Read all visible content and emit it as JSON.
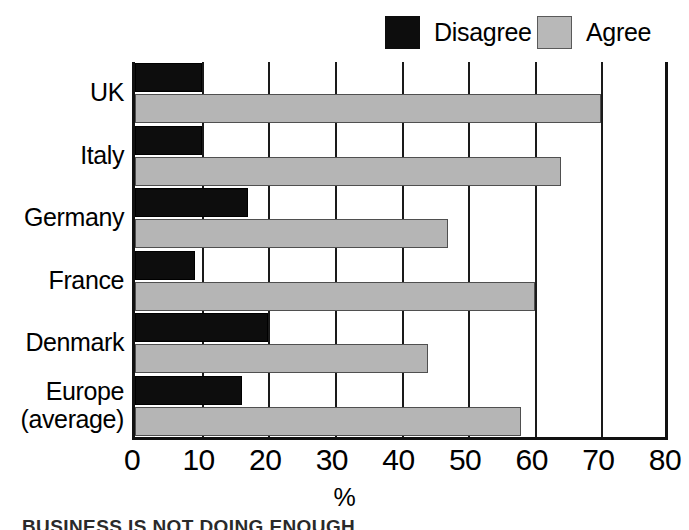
{
  "chart_data": {
    "type": "bar",
    "orientation": "horizontal",
    "title": "",
    "subtitle": "",
    "xlabel": "%",
    "ylabel": "",
    "xlim": [
      0,
      80
    ],
    "xticks": [
      "0",
      "10",
      "20",
      "30",
      "40",
      "50",
      "60",
      "70",
      "80"
    ],
    "xtick_values": [
      0,
      10,
      20,
      30,
      40,
      50,
      60,
      70,
      80
    ],
    "grid": true,
    "grid_axis": "x",
    "legend_position": "top-right",
    "categories": [
      "UK",
      "Italy",
      "Germany",
      "France",
      "Denmark",
      "Europe (average)"
    ],
    "series": [
      {
        "name": "Disagree",
        "color": "#0d0d0d",
        "values": [
          10,
          10,
          17,
          9,
          20,
          16
        ]
      },
      {
        "name": "Agree",
        "color": "#b5b5b5",
        "values": [
          70,
          64,
          47,
          60,
          44,
          58
        ]
      }
    ]
  },
  "legend": {
    "entries": [
      {
        "label": "Disagree",
        "swatch": "dark"
      },
      {
        "label": "Agree",
        "swatch": "light"
      }
    ]
  },
  "axis": {
    "x_title": "%",
    "tick_labels": [
      "0",
      "10",
      "20",
      "30",
      "40",
      "50",
      "60",
      "70",
      "80"
    ],
    "category_labels": [
      {
        "line1": "UK",
        "line2": ""
      },
      {
        "line1": "Italy",
        "line2": ""
      },
      {
        "line1": "Germany",
        "line2": ""
      },
      {
        "line1": "France",
        "line2": ""
      },
      {
        "line1": "Denmark",
        "line2": ""
      },
      {
        "line1": "Europe",
        "line2": "(average)"
      }
    ]
  },
  "caption": {
    "text": "BUSINESS IS NOT DOING ENOUGH"
  }
}
